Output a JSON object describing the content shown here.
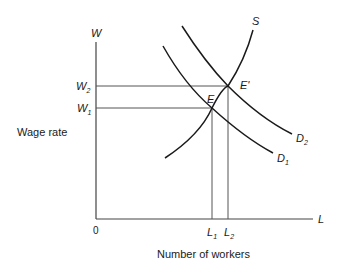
{
  "diagram": {
    "y_axis": {
      "symbol": "W",
      "label": "Wage rate"
    },
    "x_axis": {
      "symbol": "L",
      "label": "Number of workers"
    },
    "origin": "0",
    "wage_levels": [
      {
        "name": "W",
        "sub": "2"
      },
      {
        "name": "W",
        "sub": "1"
      }
    ],
    "quantity_levels": [
      {
        "name": "L",
        "sub": "1"
      },
      {
        "name": "L",
        "sub": "2"
      }
    ],
    "curves": {
      "supply": {
        "label": "S"
      },
      "demand1": {
        "name": "D",
        "sub": "1"
      },
      "demand2": {
        "name": "D",
        "sub": "2"
      }
    },
    "equilibria": {
      "initial": "E",
      "new": "E'"
    },
    "colors": {
      "curve": "#1a1a1a",
      "guide": "#555555",
      "axis": "#444444"
    }
  }
}
